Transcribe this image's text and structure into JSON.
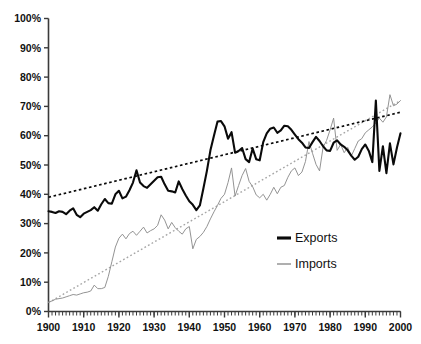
{
  "chart_data": {
    "type": "line",
    "title": "",
    "xlabel": "",
    "ylabel": "",
    "xlim": [
      1900,
      2000
    ],
    "ylim": [
      0,
      100
    ],
    "grid": false,
    "y_tick_labels": [
      "0%",
      "10%",
      "20%",
      "30%",
      "40%",
      "50%",
      "60%",
      "70%",
      "80%",
      "90%",
      "100%"
    ],
    "y_tick_values": [
      0,
      10,
      20,
      30,
      40,
      50,
      60,
      70,
      80,
      90,
      100
    ],
    "x_tick_labels": [
      "1900",
      "1910",
      "1920",
      "1930",
      "1940",
      "1950",
      "1960",
      "1970",
      "1980",
      "1990",
      "2000"
    ],
    "x_tick_values": [
      1900,
      1910,
      1920,
      1930,
      1940,
      1950,
      1960,
      1970,
      1980,
      1990,
      2000
    ],
    "x_minor_tick_step": 1,
    "legend_position": "inside bottom-right",
    "legend": [
      {
        "name": "Exports",
        "color": "#0a0a0a",
        "style": "solid-thick"
      },
      {
        "name": "Imports",
        "color": "#8d8d8d",
        "style": "solid-thin"
      }
    ],
    "x": [
      1900,
      1901,
      1902,
      1903,
      1904,
      1905,
      1906,
      1907,
      1908,
      1909,
      1910,
      1911,
      1912,
      1913,
      1914,
      1915,
      1916,
      1917,
      1918,
      1919,
      1920,
      1921,
      1922,
      1923,
      1924,
      1925,
      1926,
      1927,
      1928,
      1929,
      1930,
      1931,
      1932,
      1933,
      1934,
      1935,
      1936,
      1937,
      1938,
      1939,
      1940,
      1941,
      1942,
      1943,
      1944,
      1945,
      1946,
      1947,
      1948,
      1949,
      1950,
      1951,
      1952,
      1953,
      1954,
      1955,
      1956,
      1957,
      1958,
      1959,
      1960,
      1961,
      1962,
      1963,
      1964,
      1965,
      1966,
      1967,
      1968,
      1969,
      1970,
      1971,
      1972,
      1973,
      1974,
      1975,
      1976,
      1977,
      1978,
      1979,
      1980,
      1981,
      1982,
      1983,
      1984,
      1985,
      1986,
      1987,
      1988,
      1989,
      1990,
      1991,
      1992,
      1993,
      1994,
      1995,
      1996,
      1997,
      1998,
      1999,
      2000
    ],
    "series": [
      {
        "name": "Exports",
        "color": "#0a0a0a",
        "values": [
          34.2,
          34.0,
          33.6,
          34.2,
          34.0,
          33.2,
          34.4,
          35.2,
          33.0,
          32.2,
          33.4,
          34.0,
          34.6,
          35.6,
          34.4,
          36.6,
          38.4,
          37.0,
          36.8,
          40.0,
          41.2,
          38.6,
          39.2,
          41.4,
          44.0,
          48.2,
          44.0,
          42.8,
          42.2,
          43.4,
          44.6,
          45.8,
          46.0,
          43.4,
          41.2,
          41.0,
          40.6,
          44.4,
          41.8,
          39.6,
          37.6,
          36.4,
          34.6,
          36.2,
          42.0,
          48.0,
          55.0,
          60.0,
          64.8,
          65.0,
          63.2,
          59.0,
          61.2,
          54.2,
          54.8,
          55.8,
          52.0,
          51.0,
          55.6,
          52.0,
          51.6,
          57.8,
          60.8,
          62.4,
          62.8,
          61.0,
          61.8,
          63.4,
          63.2,
          62.0,
          60.4,
          58.8,
          57.6,
          56.0,
          55.8,
          57.8,
          59.6,
          58.2,
          56.4,
          55.0,
          54.8,
          57.6,
          58.4,
          57.0,
          56.2,
          55.0,
          53.2,
          51.8,
          52.8,
          55.4,
          57.0,
          54.8,
          51.0,
          72.0,
          48.0,
          56.4,
          47.2,
          57.4,
          50.2,
          56.0,
          60.8
        ],
        "trendline": {
          "start_value": 39.0,
          "end_value": 68.0,
          "style": "dotted",
          "color": "#0a0a0a"
        }
      },
      {
        "name": "Imports",
        "color": "#8d8d8d",
        "values": [
          3.2,
          3.6,
          4.2,
          4.4,
          4.6,
          5.0,
          5.4,
          5.8,
          5.6,
          6.0,
          6.4,
          6.6,
          7.0,
          9.0,
          7.8,
          7.8,
          8.2,
          12.0,
          17.0,
          22.0,
          25.0,
          26.4,
          24.8,
          26.6,
          27.4,
          26.0,
          27.4,
          28.8,
          26.8,
          27.6,
          28.2,
          29.4,
          33.0,
          31.2,
          28.2,
          30.4,
          28.6,
          27.4,
          26.4,
          28.2,
          29.0,
          21.4,
          24.6,
          25.6,
          27.0,
          29.0,
          31.6,
          34.0,
          36.2,
          38.6,
          40.0,
          44.0,
          49.0,
          39.4,
          43.0,
          46.4,
          48.8,
          44.4,
          42.6,
          39.8,
          38.8,
          40.0,
          38.0,
          40.0,
          42.4,
          40.2,
          42.4,
          43.0,
          45.8,
          48.0,
          49.0,
          46.4,
          47.6,
          51.2,
          58.0,
          54.0,
          50.2,
          48.0,
          56.0,
          58.4,
          62.0,
          66.0,
          55.0,
          57.0,
          54.2,
          56.0,
          53.0,
          55.6,
          58.2,
          59.0,
          61.0,
          62.0,
          63.0,
          64.4,
          66.0,
          64.6,
          66.4,
          74.0,
          70.2,
          70.8,
          72.0
        ],
        "trendline": {
          "start_value": 3.0,
          "end_value": 72.0,
          "style": "dotted",
          "color": "#a6a6a6"
        }
      }
    ]
  }
}
